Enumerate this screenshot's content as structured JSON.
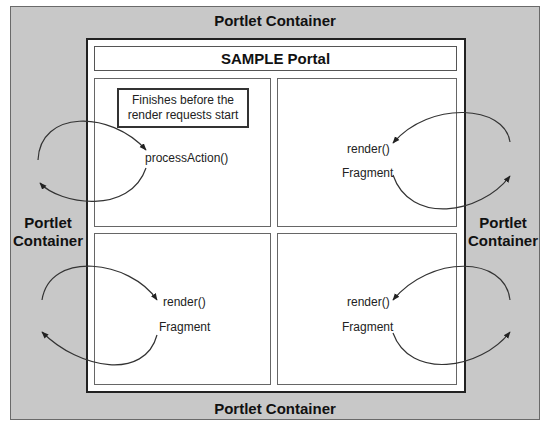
{
  "diagram": {
    "outer_container": {
      "top_label": "Portlet Container",
      "bottom_label": "Portlet Container",
      "left_label_line1": "Portlet",
      "left_label_line2": "Container",
      "right_label_line1": "Portlet",
      "right_label_line2": "Container"
    },
    "portal": {
      "title": "SAMPLE Portal"
    },
    "panels": [
      {
        "position": "top-left",
        "note_line1": "Finishes before the",
        "note_line2": "render requests start",
        "method": "processAction()"
      },
      {
        "position": "top-right",
        "method": "render()",
        "result": "Fragment"
      },
      {
        "position": "bottom-left",
        "method": "render()",
        "result": "Fragment"
      },
      {
        "position": "bottom-right",
        "method": "render()",
        "result": "Fragment"
      }
    ],
    "colors": {
      "container_fill": "#c8c8c8",
      "portal_fill": "#ffffff",
      "line": "#222222"
    }
  }
}
